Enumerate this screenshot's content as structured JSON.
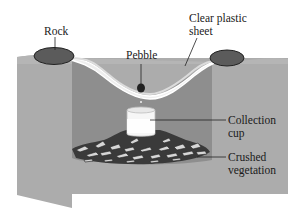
{
  "diagram": {
    "type": "solar-still-cross-section",
    "labels": {
      "rock": "Rock",
      "sheet_line1": "Clear plastic",
      "sheet_line2": "sheet",
      "pebble": "Pebble",
      "cup_line1": "Collection",
      "cup_line2": "cup",
      "veg_line1": "Crushed",
      "veg_line2": "vegetation"
    },
    "colors": {
      "ground": "#a9a9a9",
      "pit": "#8f8f8f",
      "sheet": "#e6e6e6",
      "rock": "#5a5a5a",
      "cup": "#f4f4f4",
      "vegetation_dark": "#3a3a3a",
      "vegetation_light": "#d8d8d8",
      "leader_line": "#222222"
    }
  }
}
